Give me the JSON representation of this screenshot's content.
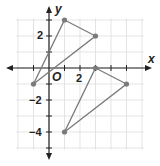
{
  "chart_data": {
    "type": "scatter",
    "title": "",
    "xlabel": "x",
    "ylabel": "y",
    "origin_label": "O",
    "xlim": [
      -2,
      6
    ],
    "ylim": [
      -5,
      3
    ],
    "grid": true,
    "x_tick_labels": [
      "2"
    ],
    "y_tick_labels": [
      "2",
      "-2",
      "-4"
    ],
    "series": [
      {
        "name": "Triangle 1",
        "shape": "polygon",
        "points": [
          [
            1,
            3
          ],
          [
            3,
            2
          ],
          [
            -1,
            -1
          ]
        ],
        "color": "#7a7a7a"
      },
      {
        "name": "Triangle 2",
        "shape": "polygon",
        "points": [
          [
            3,
            0
          ],
          [
            5,
            -1
          ],
          [
            1,
            -4
          ]
        ],
        "color": "#7a7a7a"
      }
    ]
  },
  "labels": {
    "x_axis": "x",
    "y_axis": "y",
    "origin": "O",
    "x_tick_2": "2",
    "y_tick_2": "2",
    "y_tick_neg2": "−2",
    "y_tick_neg4": "−4"
  }
}
